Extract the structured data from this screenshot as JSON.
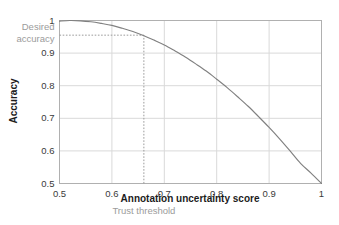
{
  "chart_data": {
    "type": "line",
    "title": "",
    "xlabel": "Annotation uncertainty score",
    "ylabel": "Accuracy",
    "xlim": [
      0.5,
      1.0
    ],
    "ylim": [
      0.5,
      1.0
    ],
    "grid": true,
    "legend_position": "none",
    "xticks": [
      "0.5",
      "0.6",
      "0.7",
      "0.8",
      "0.9",
      "1"
    ],
    "xtick_values": [
      0.5,
      0.6,
      0.7,
      0.8,
      0.9,
      1.0
    ],
    "yticks": [
      "0.5",
      "0.6",
      "0.7",
      "0.8",
      "0.9",
      "1"
    ],
    "ytick_values": [
      0.5,
      0.6,
      0.7,
      0.8,
      0.9,
      1.0
    ],
    "series": [
      {
        "name": "accuracy-vs-uncertainty",
        "color": "#808080",
        "x": [
          0.5,
          0.52,
          0.54,
          0.56,
          0.58,
          0.6,
          0.62,
          0.64,
          0.66,
          0.68,
          0.7,
          0.72,
          0.74,
          0.76,
          0.78,
          0.8,
          0.82,
          0.84,
          0.86,
          0.88,
          0.9,
          0.92,
          0.94,
          0.96,
          0.98,
          1.0
        ],
        "values": [
          0.998,
          1.0,
          0.999,
          0.996,
          0.991,
          0.985,
          0.976,
          0.966,
          0.954,
          0.94,
          0.925,
          0.907,
          0.888,
          0.867,
          0.845,
          0.82,
          0.794,
          0.766,
          0.737,
          0.705,
          0.672,
          0.637,
          0.6,
          0.562,
          0.532,
          0.5
        ]
      }
    ],
    "annotations": [
      {
        "name": "desired-accuracy",
        "label_line_1": "Desired",
        "label_line_2": "accuracy",
        "type": "horizontal-dotted-line",
        "y": 0.955,
        "x_start": 0.5,
        "x_end": 0.661,
        "color": "#9b9b9b"
      },
      {
        "name": "trust-threshold",
        "label": "Trust threshold",
        "type": "vertical-dotted-line",
        "x": 0.661,
        "y_start": 0.5,
        "y_end": 0.955,
        "color": "#9b9b9b"
      }
    ],
    "colors": {
      "curve": "#808080",
      "grid": "#d9d9d9",
      "axis": "#b0b0b0",
      "annotation": "#9b9b9b",
      "tick_text": "#3a3a3a",
      "axis_title": "#1c1c1c",
      "background": "#ffffff"
    }
  }
}
